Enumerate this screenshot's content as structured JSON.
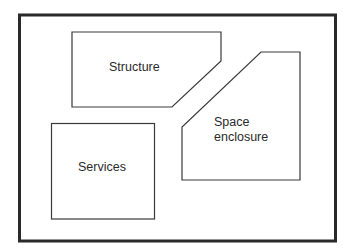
{
  "diagram": {
    "type": "block-diagram",
    "frame": {
      "stroke": "#2a2a2a"
    },
    "components": [
      {
        "id": "structure",
        "label": "Structure",
        "shape": "pentagon-chamfered-bottom-right"
      },
      {
        "id": "space-enclosure",
        "label_lines": [
          "Space",
          "enclosure"
        ],
        "shape": "pentagon-chamfered-top-left"
      },
      {
        "id": "services",
        "label": "Services",
        "shape": "rectangle"
      }
    ]
  }
}
